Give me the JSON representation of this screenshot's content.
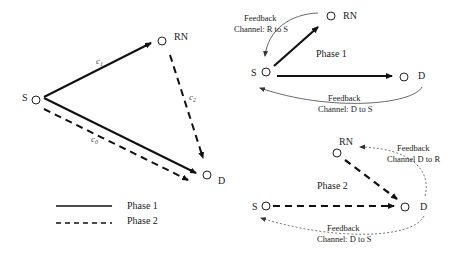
{
  "left_diagram": {
    "nodes": {
      "S": "S",
      "RN": "RN",
      "D": "D"
    },
    "edges": {
      "c1": "c",
      "c1_sub": "1",
      "c2": "c",
      "c2_sub": "2",
      "c0": "c",
      "c0_sub": "0"
    },
    "legend": [
      {
        "style": "solid",
        "label": "Phase 1"
      },
      {
        "style": "dashed",
        "label": "Phase 2"
      }
    ]
  },
  "phase1_diagram": {
    "title": "Phase 1",
    "nodes": {
      "S": "S",
      "RN": "RN",
      "D": "D"
    },
    "feedback_rs_line1": "Feedback",
    "feedback_rs_line2": "Channel: R to S",
    "feedback_ds_line1": "Feedback",
    "feedback_ds_line2": "Channel: D to S"
  },
  "phase2_diagram": {
    "title": "Phase 2",
    "nodes": {
      "S": "S",
      "RN": "RN",
      "D": "D"
    },
    "feedback_dr_line1": "Feedback",
    "feedback_dr_line2": "Channel D to R",
    "feedback_ds_line1": "Feedback",
    "feedback_ds_line2": "Channel: D to S"
  },
  "colors": {
    "line": "#111111",
    "feedback": "#555555",
    "text": "#222222"
  }
}
